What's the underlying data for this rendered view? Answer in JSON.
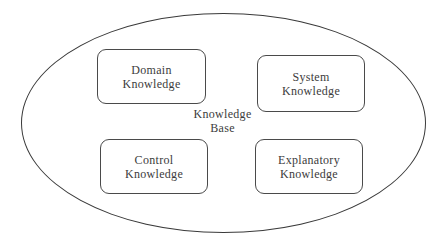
{
  "diagram": {
    "ellipse": {
      "label": "Knowledge\nBase"
    },
    "boxes": [
      {
        "id": "domain",
        "label": "Domain\nKnowledge"
      },
      {
        "id": "system",
        "label": "System\nKnowledge"
      },
      {
        "id": "control",
        "label": "Control\nKnowledge"
      },
      {
        "id": "explanatory",
        "label": "Explanatory\nKnowledge"
      }
    ],
    "colors": {
      "line": "#3a3a3a",
      "text": "#3c3c3c",
      "background": "#ffffff"
    }
  }
}
